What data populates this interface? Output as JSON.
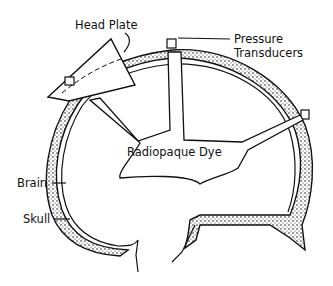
{
  "diagram": {
    "labels": {
      "head_plate": "Head Plate",
      "pressure_transducers_line1": "Pressure",
      "pressure_transducers_line2": "Transducers",
      "radiopaque_dye": "Radiopaque Dye",
      "brain": "Brain",
      "skull": "Skull"
    },
    "colors": {
      "ink": "#111111",
      "background": "#ffffff",
      "stipple": "#bdbdbd"
    }
  }
}
